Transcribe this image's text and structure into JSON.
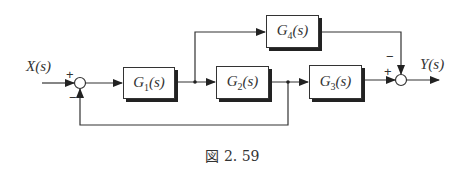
{
  "diagram": {
    "type": "block-diagram",
    "input_label": "X(s)",
    "output_label": "Y(s)",
    "blocks": [
      {
        "id": "G1",
        "label": "G1(s)",
        "base": "G",
        "sub": "1"
      },
      {
        "id": "G2",
        "label": "G2(s)",
        "base": "G",
        "sub": "2"
      },
      {
        "id": "G3",
        "label": "G3(s)",
        "base": "G",
        "sub": "3"
      },
      {
        "id": "G4",
        "label": "G4(s)",
        "base": "G",
        "sub": "4"
      }
    ],
    "summing_junctions": [
      {
        "id": "S1",
        "signs": {
          "input": "+",
          "feedback": "-"
        }
      },
      {
        "id": "S2",
        "signs": {
          "G3": "+",
          "G4": "-"
        }
      }
    ],
    "connections": [
      "X(s) -> S1 (+)",
      "S1 -> G1",
      "G1 -> G2",
      "G1 output -> G4",
      "G2 -> G3",
      "G2 output -> S1 (-) feedback",
      "G3 -> S2 (+)",
      "G4 -> S2 (-)",
      "S2 -> Y(s)"
    ],
    "s_text": "(s)",
    "plus": "+",
    "minus": "−"
  },
  "caption": "図 2. 59"
}
